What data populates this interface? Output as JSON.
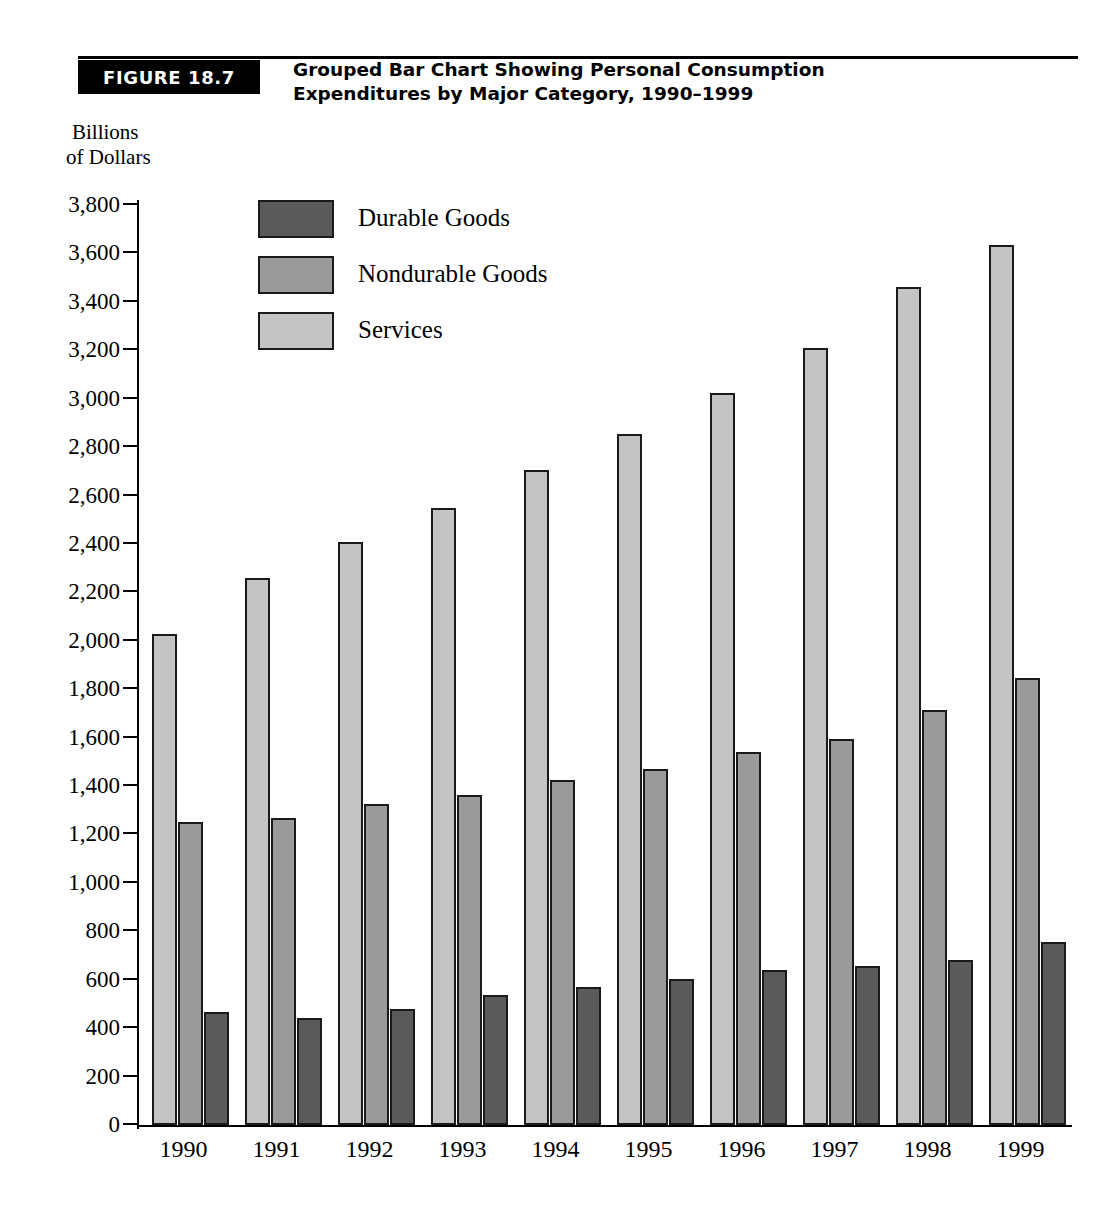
{
  "figure": {
    "tag": "FIGURE 18.7",
    "title_line1": "Grouped Bar Chart Showing Personal Consumption",
    "title_line2": "Expenditures by Major Category, 1990–1999",
    "axis_caption_line1": "Billions",
    "axis_caption_line2": "of Dollars"
  },
  "colors": {
    "services": "#c4c4c4",
    "nondurable": "#9a9a9a",
    "durable": "#5a5a5a",
    "bar_outline": "#1a1a1a",
    "axis": "#000000",
    "tag_background": "#000000",
    "tag_text": "#ffffff"
  },
  "chart_data": {
    "type": "bar",
    "title": "Grouped Bar Chart Showing Personal Consumption Expenditures by Major Category, 1990–1999",
    "xlabel": "",
    "ylabel": "Billions of Dollars",
    "ylim": [
      0,
      3800
    ],
    "ytick_step": 200,
    "grid": false,
    "legend_position": "upper-left-inside",
    "categories": [
      "1990",
      "1991",
      "1992",
      "1993",
      "1994",
      "1995",
      "1996",
      "1997",
      "1998",
      "1999"
    ],
    "ytick_labels": [
      "0",
      "200",
      "400",
      "600",
      "800",
      "1,000",
      "1,200",
      "1,400",
      "1,600",
      "1,800",
      "2,000",
      "2,200",
      "2,400",
      "2,600",
      "2,800",
      "3,000",
      "3,200",
      "3,400",
      "3,600",
      "3,800"
    ],
    "ytick_values": [
      0,
      200,
      400,
      600,
      800,
      1000,
      1200,
      1400,
      1600,
      1800,
      2000,
      2200,
      2400,
      2600,
      2800,
      3000,
      3200,
      3400,
      3600,
      3800
    ],
    "series": [
      {
        "name": "Services",
        "color": "#c4c4c4",
        "values": [
          2030,
          2260,
          2410,
          2550,
          2705,
          2855,
          3025,
          3210,
          3460,
          3635
        ]
      },
      {
        "name": "Nondurable Goods",
        "color": "#9a9a9a",
        "values": [
          1250,
          1270,
          1325,
          1365,
          1425,
          1470,
          1540,
          1595,
          1715,
          1845
        ]
      },
      {
        "name": "Durable Goods",
        "color": "#5a5a5a",
        "values": [
          467,
          440,
          480,
          535,
          570,
          605,
          640,
          655,
          680,
          755
        ]
      }
    ],
    "bar_order_in_group": [
      "Services",
      "Nondurable Goods",
      "Durable Goods"
    ],
    "legend_order": [
      "Durable Goods",
      "Nondurable Goods",
      "Services"
    ]
  },
  "legend": [
    {
      "label": "Durable Goods",
      "color": "#5a5a5a"
    },
    {
      "label": "Nondurable Goods",
      "color": "#9a9a9a"
    },
    {
      "label": "Services",
      "color": "#c4c4c4"
    }
  ]
}
